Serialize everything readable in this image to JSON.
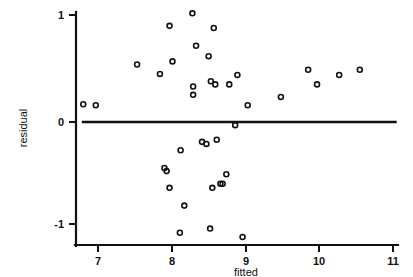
{
  "chart_data": {
    "type": "scatter",
    "title": "",
    "subtitle": "",
    "xlabel": "fitted",
    "ylabel": "residual",
    "xlim": [
      6.7,
      11.05
    ],
    "ylim": [
      -1.22,
      1.1
    ],
    "xticks": [
      7,
      8,
      9,
      10,
      11
    ],
    "xticklabels": [
      "7",
      "8",
      "9",
      "10",
      "11"
    ],
    "yticks": [
      1,
      0,
      -1
    ],
    "yticklabels": [
      "1",
      "0",
      "-1"
    ],
    "grid": false,
    "legend": null,
    "annotations": [
      {
        "kind": "horizontal-reference-line",
        "y": 0,
        "x_start": 6.78,
        "x_end": 11.05,
        "label": "zero-residual-line"
      }
    ],
    "marker": {
      "shape": "open-circle",
      "size": 4,
      "edge_color": "#111111",
      "face_color": "none"
    },
    "series": [
      {
        "name": "residuals",
        "n_points": 38,
        "x": [
          6.8,
          6.97,
          7.53,
          7.84,
          7.9,
          7.93,
          7.97,
          7.97,
          8.01,
          8.11,
          8.12,
          8.17,
          8.28,
          8.29,
          8.29,
          8.33,
          8.41,
          8.47,
          8.5,
          8.52,
          8.53,
          8.55,
          8.57,
          8.59,
          8.61,
          8.66,
          8.69,
          8.74,
          8.78,
          8.86,
          8.89,
          8.96,
          9.03,
          9.48,
          9.85,
          9.97,
          10.27,
          10.55
        ],
        "y": [
          0.17,
          0.16,
          0.55,
          0.46,
          -0.44,
          -0.47,
          0.92,
          -0.63,
          0.58,
          -1.06,
          -0.27,
          -0.8,
          1.04,
          0.34,
          0.26,
          0.73,
          -0.19,
          -0.21,
          0.63,
          -1.02,
          0.39,
          -0.63,
          0.9,
          0.36,
          -0.17,
          -0.59,
          -0.59,
          -0.5,
          0.36,
          -0.03,
          0.45,
          -1.1,
          0.16,
          0.24,
          0.5,
          0.36,
          0.45,
          0.5
        ]
      }
    ]
  },
  "axes": {
    "x_axis_name": "fitted-axis",
    "y_axis_name": "residual-axis"
  }
}
